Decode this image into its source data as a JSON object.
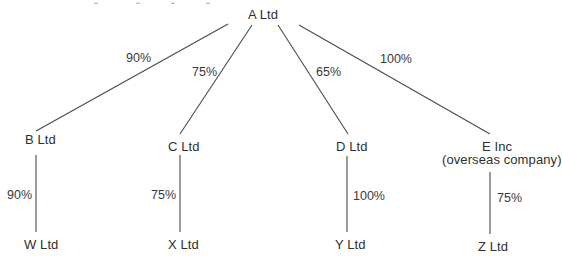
{
  "diagram": {
    "type": "group-structure",
    "nodes": {
      "a": {
        "label": "A Ltd"
      },
      "b": {
        "label": "B Ltd"
      },
      "c": {
        "label": "C Ltd"
      },
      "d": {
        "label": "D Ltd"
      },
      "e": {
        "label": "E Inc",
        "sublabel": "(overseas company)"
      },
      "w": {
        "label": "W Ltd"
      },
      "x": {
        "label": "X Ltd"
      },
      "y": {
        "label": "Y Ltd"
      },
      "z": {
        "label": "Z Ltd"
      }
    },
    "edges": {
      "a_b": {
        "from": "A Ltd",
        "to": "B Ltd",
        "pct": "90%"
      },
      "a_c": {
        "from": "A Ltd",
        "to": "C Ltd",
        "pct": "75%"
      },
      "a_d": {
        "from": "A Ltd",
        "to": "D Ltd",
        "pct": "65%"
      },
      "a_e": {
        "from": "A Ltd",
        "to": "E Inc",
        "pct": "100%"
      },
      "b_w": {
        "from": "B Ltd",
        "to": "W Ltd",
        "pct": "90%"
      },
      "c_x": {
        "from": "C Ltd",
        "to": "X Ltd",
        "pct": "75%"
      },
      "d_y": {
        "from": "D Ltd",
        "to": "Y Ltd",
        "pct": "100%"
      },
      "e_z": {
        "from": "E Inc",
        "to": "Z Ltd",
        "pct": "75%"
      }
    },
    "colors": {
      "line": "#4a4a4a",
      "text": "#2f2f2f",
      "background": "#ffffff"
    }
  }
}
